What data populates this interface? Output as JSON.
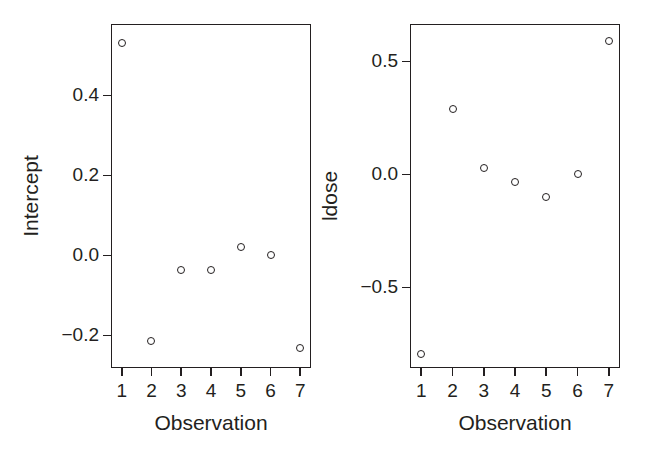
{
  "chart_data": [
    {
      "type": "scatter",
      "title": "",
      "xlabel": "Observation",
      "ylabel": "Intercept",
      "x": [
        1,
        2,
        3,
        4,
        5,
        6,
        7
      ],
      "values": [
        0.53,
        -0.215,
        -0.037,
        -0.037,
        0.022,
        0.0,
        -0.232
      ],
      "xticks": [
        "1",
        "2",
        "3",
        "4",
        "5",
        "6",
        "7"
      ],
      "xtickvalues": [
        1,
        2,
        3,
        4,
        5,
        6,
        7
      ],
      "yticks": [
        "0.4",
        "0.2",
        "0.0",
        "-0.2"
      ],
      "ytickvalues": [
        0.4,
        0.2,
        0.0,
        -0.2
      ],
      "xlim": [
        0.64,
        7.36
      ],
      "ylim": [
        -0.2815,
        0.5785
      ],
      "grid": false,
      "legend": false,
      "marker": "open-circle",
      "color": "#231f20"
    },
    {
      "type": "scatter",
      "title": "",
      "xlabel": "Observation",
      "ylabel": "ldose",
      "x": [
        1,
        2,
        3,
        4,
        5,
        6,
        7
      ],
      "values": [
        -0.795,
        0.29,
        0.03,
        -0.035,
        -0.1,
        0.0,
        0.59
      ],
      "xticks": [
        "1",
        "2",
        "3",
        "4",
        "5",
        "6",
        "7"
      ],
      "xtickvalues": [
        1,
        2,
        3,
        4,
        5,
        6,
        7
      ],
      "yticks": [
        "0.5",
        "0.0",
        "-0.5"
      ],
      "ytickvalues": [
        0.5,
        0.0,
        -0.5
      ],
      "xlim": [
        0.64,
        7.36
      ],
      "ylim": [
        -0.8565,
        0.6655
      ],
      "grid": false,
      "legend": false,
      "marker": "open-circle",
      "color": "#231f20"
    }
  ],
  "figure": {
    "background": "#ffffff",
    "foreground": "#231f20",
    "panel_count": 2
  }
}
